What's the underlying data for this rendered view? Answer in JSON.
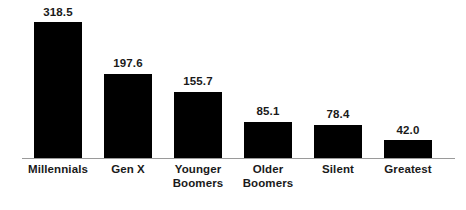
{
  "chart_data": {
    "type": "bar",
    "title": "",
    "subtitle": "",
    "xlabel": "",
    "ylabel": "",
    "ylim": [
      0,
      318.5
    ],
    "grid": false,
    "legend": false,
    "axis_line_color": "#9a9a9a",
    "bar_color": "#000000",
    "label_color": "#1a1a1a",
    "categories": [
      "Millennials",
      "Gen X",
      "Younger Boomers",
      "Older Boomers",
      "Silent",
      "Greatest"
    ],
    "values": [
      318.5,
      197.6,
      155.7,
      85.1,
      78.4,
      42.0
    ],
    "value_labels": [
      "318.5",
      "197.6",
      "155.7",
      "85.1",
      "78.4",
      "42.0"
    ],
    "bars": [
      {
        "category_line1": "Millennials",
        "category_line2": "",
        "value": 318.5,
        "value_label": "318.5"
      },
      {
        "category_line1": "Gen X",
        "category_line2": "",
        "value": 197.6,
        "value_label": "197.6"
      },
      {
        "category_line1": "Younger",
        "category_line2": "Boomers",
        "value": 155.7,
        "value_label": "155.7"
      },
      {
        "category_line1": "Older",
        "category_line2": "Boomers",
        "value": 85.1,
        "value_label": "85.1"
      },
      {
        "category_line1": "Silent",
        "category_line2": "",
        "value": 78.4,
        "value_label": "78.4"
      },
      {
        "category_line1": "Greatest",
        "category_line2": "",
        "value": 42.0,
        "value_label": "42.0"
      }
    ]
  }
}
